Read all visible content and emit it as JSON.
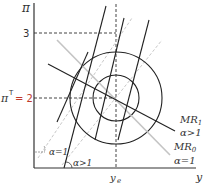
{
  "diagram": {
    "y_axis_label": "π",
    "x_axis_label": "y",
    "y_tick_3": "3",
    "y_tick_target_symbol": "π",
    "y_tick_target_sup": "T",
    "y_tick_target_value": "= 2",
    "x_tick_ye": "y",
    "x_tick_ye_sub": "e",
    "angle_label_alpha1": "α=1",
    "angle_label_alpha_gt1": "α>1",
    "mr1_label": "MR",
    "mr1_sub": "1",
    "mr1_cond": "α>1",
    "mr0_label": "MR",
    "mr0_sub": "0",
    "mr0_cond": "α=1",
    "colors": {
      "axis": "#333333",
      "black_line": "#222222",
      "grey_line": "#c4c4c4",
      "target_value": "#c0392b"
    }
  }
}
